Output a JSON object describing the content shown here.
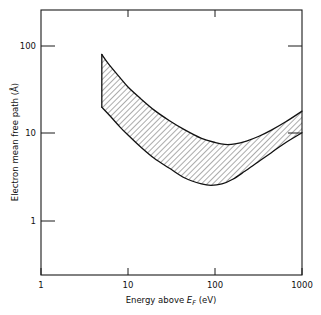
{
  "chart_data": {
    "type": "area",
    "title": "",
    "subtitle": "",
    "xlabel_parts": {
      "pre": "Energy above ",
      "symbol": "E",
      "subscript": "F",
      "post": " (eV)"
    },
    "xlabel": "Energy above E_F (eV)",
    "ylabel": "Electron mean free path (Å)",
    "xscale": "log",
    "yscale": "log",
    "xlim": [
      1,
      1000
    ],
    "ylim": [
      0.5,
      300
    ],
    "grid": false,
    "legend": null,
    "xticks": [
      1,
      10,
      100,
      1000
    ],
    "xtick_labels": [
      "1",
      "10",
      "100",
      "1000"
    ],
    "yticks": [
      1,
      10,
      100
    ],
    "ytick_labels": [
      "1",
      "10",
      "100"
    ],
    "band_fill": "hatch-45-diagonal",
    "band_note": "Universal curve: shaded band between upper and lower bounds of electron inelastic mean free path",
    "series": [
      {
        "name": "upper-bound",
        "x": [
          5,
          6,
          8,
          10,
          14,
          20,
          30,
          45,
          70,
          100,
          130,
          170,
          230,
          320,
          450,
          650,
          1000
        ],
        "y": [
          80,
          62,
          44,
          34,
          25,
          18.5,
          14.0,
          11.0,
          8.8,
          7.9,
          7.5,
          7.6,
          8.2,
          9.3,
          11.0,
          13.6,
          18.0
        ]
      },
      {
        "name": "lower-bound",
        "x": [
          5,
          6,
          8,
          10,
          14,
          20,
          30,
          45,
          70,
          90,
          120,
          160,
          220,
          310,
          440,
          640,
          1000
        ],
        "y": [
          20.0,
          16.5,
          12.0,
          9.6,
          7.0,
          5.2,
          4.0,
          3.1,
          2.65,
          2.55,
          2.65,
          3.0,
          3.7,
          4.7,
          6.0,
          7.8,
          10.2
        ]
      }
    ]
  },
  "axes": {
    "y_axis_title": "Electron mean free path (Å)",
    "x_tick_1": "1",
    "x_tick_2": "10",
    "x_tick_3": "100",
    "x_tick_4": "1000",
    "y_tick_1": "1",
    "y_tick_2": "10",
    "y_tick_3": "100"
  },
  "colors": {
    "background": "#ffffff",
    "line": "#111111",
    "frame": "#1a1a1a",
    "hatch": "#222222"
  }
}
